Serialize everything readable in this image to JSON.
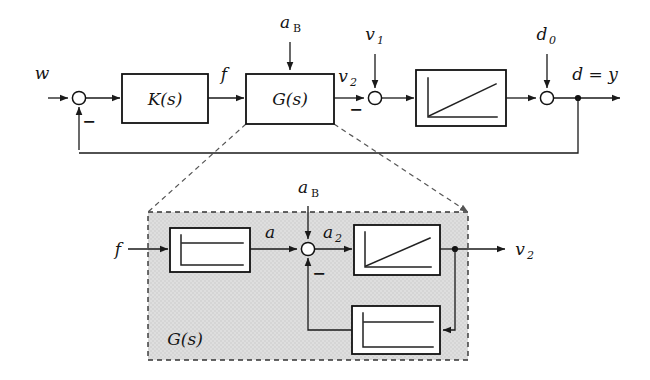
{
  "figure": {
    "colors": {
      "line": "#1a1a1a",
      "block_stroke": "#111111",
      "panel_fill": "#dcdcdc",
      "panel_stroke": "#333333",
      "background": "#ffffff",
      "text": "#141414"
    }
  },
  "top_level": {
    "signals": {
      "reference": "w",
      "controller_output": "f",
      "plant_output": "v",
      "plant_output_sub": "2",
      "disturbance_bearing": "a",
      "disturbance_bearing_sub": "B",
      "disturbance_v1": "v",
      "disturbance_v1_sub": "1",
      "disturbance_d0": "d",
      "disturbance_d0_sub": "0",
      "output": "d = y",
      "minus_sign": "−"
    },
    "blocks": [
      {
        "id": "controller",
        "label": "K(s)",
        "kind": "text"
      },
      {
        "id": "plant",
        "label": "G(s)",
        "kind": "text"
      },
      {
        "id": "integrator",
        "label": "",
        "kind": "icon",
        "icon": "ramp-response-icon"
      }
    ],
    "summing_junctions": [
      {
        "id": "sum-error",
        "sign": "−",
        "sign_position": "below"
      },
      {
        "id": "sum-v1",
        "sign": "−",
        "sign_position": "below-left"
      },
      {
        "id": "sum-d0",
        "sign": "",
        "sign_position": "none"
      }
    ]
  },
  "detail_panel": {
    "label": "G(s)",
    "signals": {
      "input": "f",
      "after_lag": "a",
      "after_sum": "a",
      "after_sum_sub": "2",
      "disturbance_bearing": "a",
      "disturbance_bearing_sub": "B",
      "output": "v",
      "output_sub": "2",
      "minus_sign": "−"
    },
    "blocks": [
      {
        "id": "detail-lag",
        "label": "",
        "kind": "icon",
        "icon": "step-response-icon"
      },
      {
        "id": "detail-integrator",
        "label": "",
        "kind": "icon",
        "icon": "ramp-response-icon"
      },
      {
        "id": "detail-feedback",
        "label": "",
        "kind": "icon",
        "icon": "step-response-icon"
      }
    ],
    "summing_junctions": [
      {
        "id": "detail-sum",
        "sign": "−",
        "sign_position": "below-right"
      }
    ]
  }
}
